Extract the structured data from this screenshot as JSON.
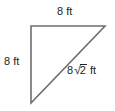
{
  "figure": {
    "background_color": "#ffffff",
    "stroke_color": "#6d6e71",
    "text_color": "#231f20"
  },
  "labels": {
    "top_side": "8 ft",
    "left_side": "8 ft",
    "hypotenuse_coefficient": "8",
    "hypotenuse_radical_symbol": "√",
    "hypotenuse_radicand": "2",
    "hypotenuse_unit": " ft",
    "hypotenuse_full": "8√2 ft"
  },
  "geometry": {
    "type": "right-triangle",
    "vertices": [
      {
        "name": "top-left-right-angle",
        "x": 31,
        "y": 26
      },
      {
        "name": "top-right",
        "x": 105,
        "y": 26
      },
      {
        "name": "bottom-left",
        "x": 31,
        "y": 103
      }
    ],
    "sides": [
      {
        "name": "top-leg",
        "length": "8 ft"
      },
      {
        "name": "left-leg",
        "length": "8 ft"
      },
      {
        "name": "hypotenuse",
        "length": "8√2 ft"
      }
    ]
  }
}
